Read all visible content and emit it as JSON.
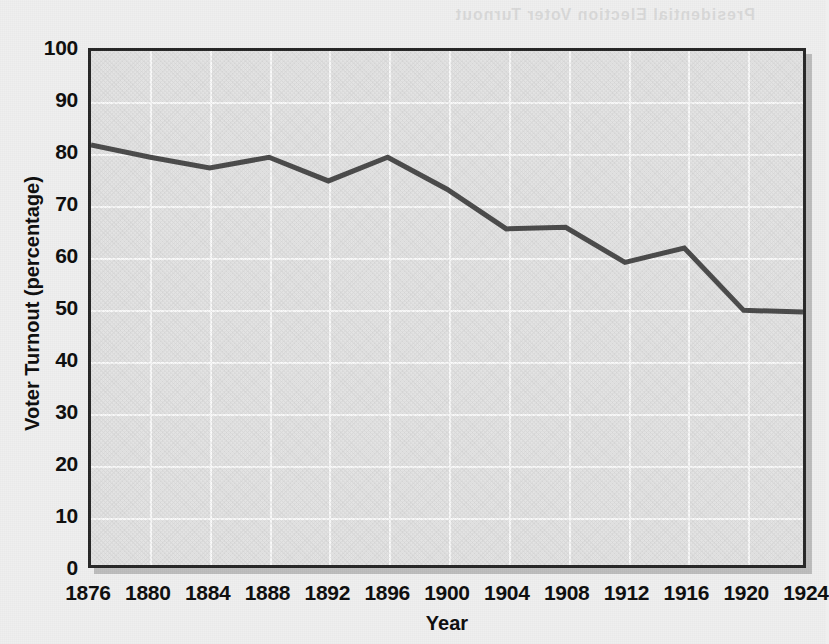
{
  "chart_data": {
    "type": "line",
    "title": "",
    "xlabel": "Year",
    "ylabel": "Voter Turnout (percentage)",
    "xlim": [
      1876,
      1924
    ],
    "ylim": [
      0,
      100
    ],
    "grid": true,
    "legend": "none",
    "x": [
      1876,
      1880,
      1884,
      1888,
      1892,
      1896,
      1900,
      1904,
      1908,
      1912,
      1916,
      1920,
      1924
    ],
    "xticklabels": [
      "1876",
      "1880",
      "1884",
      "1888",
      "1892",
      "1896",
      "1900",
      "1904",
      "1908",
      "1912",
      "1916",
      "1920",
      "1924"
    ],
    "yticks": [
      0,
      10,
      20,
      30,
      40,
      50,
      60,
      70,
      80,
      90,
      100
    ],
    "yticklabels": [
      "0",
      "10",
      "20",
      "30",
      "40",
      "50",
      "60",
      "70",
      "80",
      "90",
      "100"
    ],
    "series": [
      {
        "name": "Voter Turnout",
        "color": "#4a4a4a",
        "values": [
          81.8,
          79.4,
          77.3,
          79.4,
          74.8,
          79.4,
          73.2,
          65.5,
          65.8,
          59.0,
          61.8,
          49.7,
          49.4
        ]
      }
    ]
  },
  "style": {
    "plot_background": "#e4e4e4",
    "page_background": "#efefef",
    "gridline_color": "#fbfbfb",
    "axis_border_color": "#262626",
    "line_color": "#4a4a4a",
    "text_color": "#0d0d0d"
  },
  "artifacts": {
    "bleed_through_text": "Presidential Election Voter Turnout"
  }
}
